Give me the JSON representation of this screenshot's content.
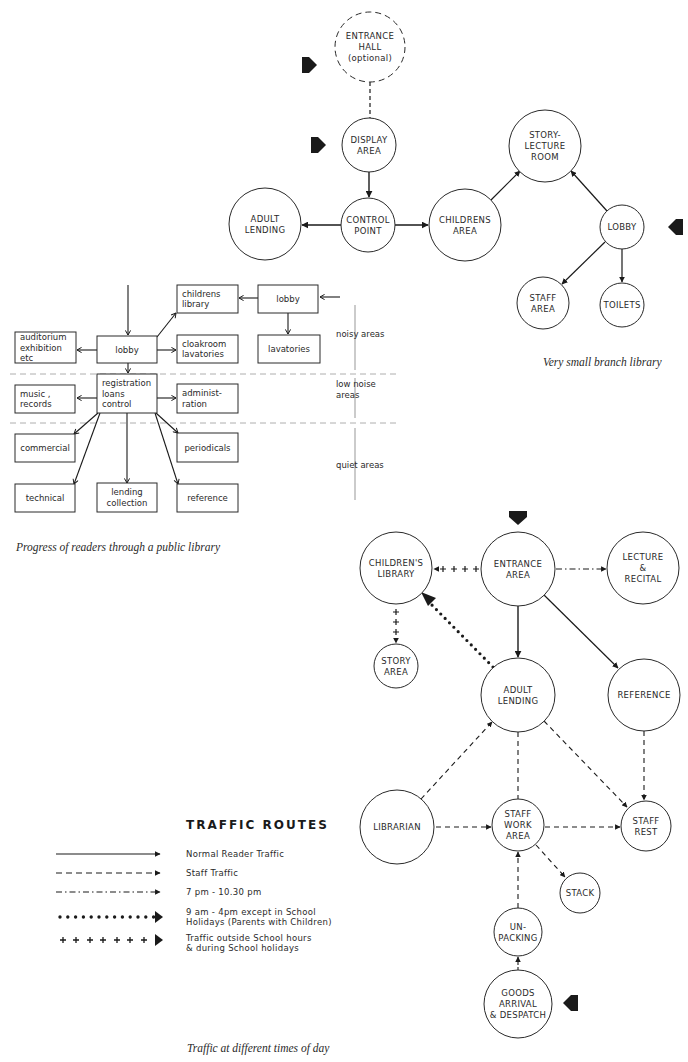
{
  "diagram1": {
    "caption": "Very small branch library",
    "nodes": [
      {
        "id": "entrance-hall",
        "lines": [
          "ENTRANCE",
          "HALL",
          "(optional)"
        ],
        "cx": 370,
        "cy": 47,
        "r": 35,
        "dashed": true
      },
      {
        "id": "display-area",
        "lines": [
          "DISPLAY",
          "AREA"
        ],
        "cx": 369,
        "cy": 145,
        "r": 27
      },
      {
        "id": "control-point",
        "lines": [
          "CONTROL",
          "POINT"
        ],
        "cx": 368,
        "cy": 225,
        "r": 27
      },
      {
        "id": "adult-lending",
        "lines": [
          "ADULT",
          "LENDING"
        ],
        "cx": 265,
        "cy": 224,
        "r": 36
      },
      {
        "id": "childrens-area",
        "lines": [
          "CHILDRENS",
          "AREA"
        ],
        "cx": 465,
        "cy": 225,
        "r": 36
      },
      {
        "id": "story-lecture-room",
        "lines": [
          "STORY-",
          "LECTURE",
          "ROOM"
        ],
        "cx": 545,
        "cy": 146,
        "r": 36
      },
      {
        "id": "lobby",
        "lines": [
          "LOBBY"
        ],
        "cx": 622,
        "cy": 227,
        "r": 22
      },
      {
        "id": "staff-area",
        "lines": [
          "STAFF",
          "AREA"
        ],
        "cx": 543,
        "cy": 303,
        "r": 26
      },
      {
        "id": "toilets",
        "lines": [
          "TOILETS"
        ],
        "cx": 622,
        "cy": 305,
        "r": 22
      }
    ],
    "entry_arrows": [
      {
        "x": 310,
        "y": 65,
        "dir": "right"
      },
      {
        "x": 319,
        "y": 145,
        "dir": "right"
      },
      {
        "x": 675,
        "y": 227,
        "dir": "left"
      }
    ]
  },
  "diagram2": {
    "caption": "Progress of readers through a public library",
    "boxes": [
      {
        "id": "auditorium",
        "lines": [
          "auditorium",
          "exhibition",
          "etc"
        ],
        "x": 15,
        "y": 332,
        "w": 61,
        "h": 31
      },
      {
        "id": "lobby-main",
        "lines": [
          "lobby"
        ],
        "x": 97,
        "y": 336,
        "w": 60,
        "h": 27,
        "center": true
      },
      {
        "id": "childrens-library",
        "lines": [
          "childrens",
          "library"
        ],
        "x": 177,
        "y": 285,
        "w": 61,
        "h": 28
      },
      {
        "id": "lobby-side",
        "lines": [
          "lobby"
        ],
        "x": 258,
        "y": 285,
        "w": 60,
        "h": 28,
        "center": true
      },
      {
        "id": "cloakroom",
        "lines": [
          "cloakroom",
          "lavatories"
        ],
        "x": 177,
        "y": 335,
        "w": 61,
        "h": 28
      },
      {
        "id": "lavatories",
        "lines": [
          "lavatories"
        ],
        "x": 258,
        "y": 335,
        "w": 62,
        "h": 28,
        "center": true
      },
      {
        "id": "registration",
        "lines": [
          "registration",
          "loans",
          "control"
        ],
        "x": 97,
        "y": 374,
        "w": 60,
        "h": 39
      },
      {
        "id": "music",
        "lines": [
          "music ,",
          "records"
        ],
        "x": 15,
        "y": 385,
        "w": 60,
        "h": 28
      },
      {
        "id": "administration",
        "lines": [
          "administ-",
          "ration"
        ],
        "x": 177,
        "y": 384,
        "w": 61,
        "h": 29
      },
      {
        "id": "commercial",
        "lines": [
          "commercial"
        ],
        "x": 15,
        "y": 434,
        "w": 60,
        "h": 28,
        "center": true
      },
      {
        "id": "periodicals",
        "lines": [
          "periodicals"
        ],
        "x": 177,
        "y": 433,
        "w": 61,
        "h": 29,
        "center": true
      },
      {
        "id": "technical",
        "lines": [
          "technical"
        ],
        "x": 15,
        "y": 484,
        "w": 60,
        "h": 28,
        "center": true
      },
      {
        "id": "lending-collection",
        "lines": [
          "lending",
          "collection"
        ],
        "x": 97,
        "y": 483,
        "w": 60,
        "h": 29,
        "center": true
      },
      {
        "id": "reference",
        "lines": [
          "reference"
        ],
        "x": 177,
        "y": 484,
        "w": 61,
        "h": 28,
        "center": true
      }
    ],
    "zones": [
      {
        "label": [
          "noisy areas"
        ],
        "y": 337
      },
      {
        "label": [
          "low noise",
          "areas"
        ],
        "y": 387
      },
      {
        "label": [
          "quiet areas"
        ],
        "y": 468
      }
    ]
  },
  "diagram3": {
    "caption": "Traffic at different times of day",
    "nodes": [
      {
        "id": "childrens-library",
        "lines": [
          "CHILDREN'S",
          "LIBRARY"
        ],
        "cx": 396,
        "cy": 568,
        "r": 36
      },
      {
        "id": "entrance-area",
        "lines": [
          "ENTRANCE",
          "AREA"
        ],
        "cx": 518,
        "cy": 569,
        "r": 37
      },
      {
        "id": "lecture-recital",
        "lines": [
          "LECTURE",
          "&",
          "RECITAL"
        ],
        "cx": 643,
        "cy": 568,
        "r": 36
      },
      {
        "id": "story-area",
        "lines": [
          "STORY",
          "AREA"
        ],
        "cx": 396,
        "cy": 666,
        "r": 22
      },
      {
        "id": "adult-lending",
        "lines": [
          "ADULT",
          "LENDING"
        ],
        "cx": 518,
        "cy": 695,
        "r": 37
      },
      {
        "id": "reference",
        "lines": [
          "REFERENCE"
        ],
        "cx": 644,
        "cy": 695,
        "r": 36
      },
      {
        "id": "librarian",
        "lines": [
          "LIBRARIAN"
        ],
        "cx": 397,
        "cy": 827,
        "r": 37
      },
      {
        "id": "staff-work-area",
        "lines": [
          "STAFF",
          "WORK",
          "AREA"
        ],
        "cx": 518,
        "cy": 825,
        "r": 26
      },
      {
        "id": "staff-rest",
        "lines": [
          "STAFF",
          "REST"
        ],
        "cx": 646,
        "cy": 826,
        "r": 25
      },
      {
        "id": "stack",
        "lines": [
          "STACK"
        ],
        "cx": 580,
        "cy": 893,
        "r": 20
      },
      {
        "id": "unpacking",
        "lines": [
          "UN-",
          "PACKING"
        ],
        "cx": 518,
        "cy": 932,
        "r": 24
      },
      {
        "id": "goods-arrival",
        "lines": [
          "GOODS",
          "ARRIVAL",
          "& DESPATCH"
        ],
        "cx": 518,
        "cy": 1004,
        "r": 34
      }
    ],
    "entry_arrows": [
      {
        "x": 518,
        "y": 518,
        "dir": "down"
      },
      {
        "x": 570,
        "y": 1003,
        "dir": "left"
      }
    ]
  },
  "legend": {
    "title": "TRAFFIC    ROUTES",
    "items": [
      {
        "style": "solid",
        "lines": [
          "Normal  Reader  Traffic"
        ],
        "y": 854
      },
      {
        "style": "dashed",
        "lines": [
          "Staff  Traffic"
        ],
        "y": 873
      },
      {
        "style": "dashdot",
        "lines": [
          "7 pm - 10.30 pm"
        ],
        "y": 892
      },
      {
        "style": "dotted",
        "lines": [
          "9 am - 4pm except  in School",
          "Holidays (Parents with Children)"
        ],
        "y": 917
      },
      {
        "style": "plus",
        "lines": [
          "Traffic outside School  hours",
          "& during School  holidays"
        ],
        "y": 940
      }
    ]
  },
  "colors": {
    "ink": "#1a1a1a",
    "paper": "#ffffff"
  }
}
